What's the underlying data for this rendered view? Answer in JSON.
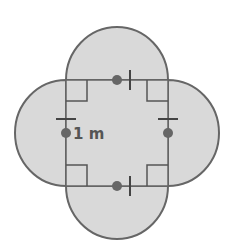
{
  "diagram": {
    "side_length_label": "1 m",
    "colors": {
      "fill": "#d9d9d9",
      "stroke": "#666666",
      "background": "#ffffff"
    },
    "square": {
      "x": 66,
      "y": 80,
      "width": 102,
      "height": 106
    },
    "semicircles": [
      "top",
      "right",
      "bottom",
      "left"
    ],
    "markers": [
      "right-angle-marks",
      "equal-length-ticks",
      "midpoint-dots"
    ]
  }
}
